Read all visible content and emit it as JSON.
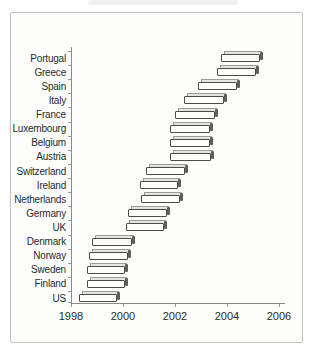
{
  "figure": {
    "background": "#fdfdfc",
    "border_color": "#c2c2c0",
    "axis_color": "#8a8a8a",
    "text_color": "#2a2a2a"
  },
  "chart_data": {
    "type": "bar",
    "subtype": "floating-range-bars",
    "orientation": "horizontal",
    "title": "",
    "xlabel": "",
    "ylabel": "",
    "xlim": [
      1998,
      2006
    ],
    "xticks": [
      1998,
      2000,
      2002,
      2004,
      2006
    ],
    "xtick_labels": [
      "1998",
      "2000",
      "2002",
      "2004",
      "2006"
    ],
    "grid": false,
    "legend": null,
    "bar_style": {
      "effect": "3d-extruded",
      "fill": "#fffffe",
      "outline": "#4a4a48",
      "extrusion_top": "#e4e4e1",
      "extrusion_side": "#605f5c"
    },
    "categories_top_to_bottom": [
      "Portugal",
      "Greece",
      "Spain",
      "Italy",
      "France",
      "Luxembourg",
      "Belgium",
      "Austria",
      "Switzerland",
      "Ireland",
      "Netherlands",
      "Germany",
      "UK",
      "Denmark",
      "Norway",
      "Sweden",
      "Finland",
      "US"
    ],
    "ranges": [
      [
        2003.75,
        2005.4
      ],
      [
        2003.6,
        2005.25
      ],
      [
        2002.9,
        2004.5
      ],
      [
        2002.35,
        2004.0
      ],
      [
        2002.0,
        2003.65
      ],
      [
        2001.8,
        2003.45
      ],
      [
        2001.8,
        2003.45
      ],
      [
        2001.8,
        2003.5
      ],
      [
        2000.9,
        2002.5
      ],
      [
        2000.65,
        2002.25
      ],
      [
        2000.7,
        2002.3
      ],
      [
        2000.2,
        2001.8
      ],
      [
        2000.1,
        2001.7
      ],
      [
        1998.8,
        2000.45
      ],
      [
        1998.7,
        2000.3
      ],
      [
        1998.6,
        2000.2
      ],
      [
        1998.6,
        2000.2
      ],
      [
        1998.3,
        1999.9
      ]
    ]
  }
}
